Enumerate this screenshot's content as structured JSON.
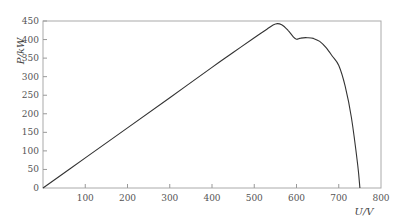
{
  "chart_data": {
    "type": "line",
    "title": "",
    "xlabel": "U/V",
    "ylabel": "P/kW",
    "xlim": [
      0,
      800
    ],
    "ylim": [
      0,
      450
    ],
    "xticks": [
      100,
      200,
      300,
      400,
      500,
      600,
      700,
      800
    ],
    "yticks": [
      0,
      50,
      100,
      150,
      200,
      250,
      300,
      350,
      400,
      450
    ],
    "grid": false,
    "legend": null,
    "series": [
      {
        "name": "P-U curve",
        "color": "#333333",
        "x": [
          0,
          100,
          200,
          300,
          400,
          450,
          500,
          530,
          550,
          565,
          580,
          592,
          600,
          610,
          625,
          640,
          655,
          670,
          685,
          700,
          715,
          730,
          745,
          750
        ],
        "y": [
          0,
          81,
          162,
          243,
          325,
          365,
          405,
          428,
          442,
          440,
          425,
          408,
          401,
          404,
          405,
          403,
          395,
          378,
          355,
          330,
          275,
          190,
          60,
          0
        ]
      }
    ],
    "annotations": [
      {
        "label": "global maximum",
        "x": 550,
        "y": 442
      },
      {
        "label": "local minimum",
        "x": 600,
        "y": 401
      },
      {
        "label": "local maximum",
        "x": 625,
        "y": 405
      }
    ]
  }
}
